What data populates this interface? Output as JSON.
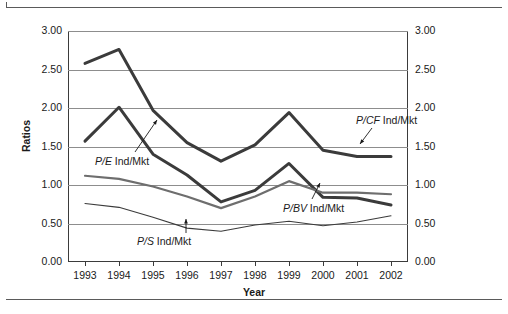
{
  "figure": {
    "has_top_rule": true,
    "has_bottom_rule": true
  },
  "chart_data": {
    "type": "line",
    "title": "",
    "xlabel": "Year",
    "ylabel": "Ratios",
    "categories": [
      "1993",
      "1994",
      "1995",
      "1996",
      "1997",
      "1998",
      "1999",
      "2000",
      "2001",
      "2002"
    ],
    "x": [
      1993,
      1994,
      1995,
      1996,
      1997,
      1998,
      1999,
      2000,
      2001,
      2002
    ],
    "ylim": [
      0.0,
      3.0
    ],
    "ytick_values": [
      0.0,
      0.5,
      1.0,
      1.5,
      2.0,
      2.5,
      3.0
    ],
    "ytick_labels_left": [
      "0.00",
      "0.50",
      "1.00",
      "1.50",
      "2.00",
      "2.50",
      "3.00"
    ],
    "ytick_labels_right": [
      "0.00",
      "0.50",
      "1.00",
      "1.50",
      "2.00",
      "2.50",
      "3.00"
    ],
    "grid": true,
    "grid_axis": "y",
    "dual_y_axis": true,
    "legend": "inline-annotations",
    "series": [
      {
        "name": "P/CF Ind/Mkt",
        "name_italic_part": "P/CF",
        "name_plain_part": " Ind/Mkt",
        "color": "#3b3b3b",
        "width": 3.0,
        "values": [
          2.58,
          2.76,
          1.97,
          1.55,
          1.31,
          1.52,
          1.94,
          1.45,
          1.37,
          1.37
        ]
      },
      {
        "name": "P/E Ind/Mkt",
        "name_italic_part": "P/E",
        "name_plain_part": " Ind/Mkt",
        "color": "#3b3b3b",
        "width": 3.0,
        "values": [
          1.57,
          2.01,
          1.4,
          1.13,
          0.78,
          0.93,
          1.28,
          0.84,
          0.83,
          0.74
        ]
      },
      {
        "name": "P/BV Ind/Mkt",
        "name_italic_part": "P/BV",
        "name_plain_part": " Ind/Mkt",
        "color": "#6e6e6e",
        "width": 2.2,
        "values": [
          1.12,
          1.08,
          0.98,
          0.85,
          0.7,
          0.85,
          1.05,
          0.9,
          0.9,
          0.88
        ]
      },
      {
        "name": "P/S Ind/Mkt",
        "name_italic_part": "P/S",
        "name_plain_part": " Ind/Mkt",
        "color": "#3b3b3b",
        "width": 1.1,
        "values": [
          0.76,
          0.71,
          0.58,
          0.44,
          0.4,
          0.48,
          0.53,
          0.47,
          0.52,
          0.6
        ]
      }
    ],
    "annotations": [
      {
        "text": "P/CF Ind/Mkt",
        "italic": "P/CF",
        "plain": " Ind/Mkt",
        "label_x": 356,
        "label_y": 114,
        "leader_from": [
          372,
          128
        ],
        "leader_to": [
          360,
          144
        ]
      },
      {
        "text": "P/E Ind/Mkt",
        "italic": "P/E",
        "plain": " Ind/Mkt",
        "label_x": 95,
        "label_y": 155,
        "leader_from": [
          135,
          152
        ],
        "leader_to": [
          157,
          120
        ]
      },
      {
        "text": "P/BV Ind/Mkt",
        "italic": "P/BV",
        "plain": " Ind/Mkt",
        "label_x": 283,
        "label_y": 202,
        "leader_from": [
          312,
          199
        ],
        "leader_to": [
          320,
          183
        ]
      },
      {
        "text": "P/S Ind/Mkt",
        "italic": "P/S",
        "plain": " Ind/Mkt",
        "label_x": 137,
        "label_y": 235,
        "leader_from": [
          186,
          233
        ],
        "leader_to": [
          186,
          219
        ]
      }
    ]
  }
}
